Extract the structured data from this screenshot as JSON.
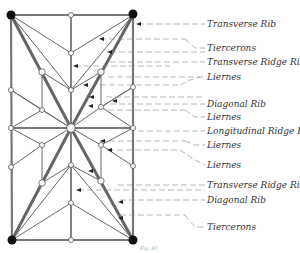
{
  "diagram": {
    "colors": {
      "rib": "#555555",
      "rib_light": "#999999",
      "boss_fill": "#ffffff",
      "corner_fill": "#111111",
      "leader": "#777777",
      "text": "#333333"
    },
    "labels": [
      {
        "text": "Transverse Rib",
        "y": 24
      },
      {
        "text": "Tiercerons",
        "y": 48
      },
      {
        "text": "Transverse Ridge Rib",
        "y": 62
      },
      {
        "text": "Liernes",
        "y": 77
      },
      {
        "text": "Diagonal Rib",
        "y": 104
      },
      {
        "text": "Liernes",
        "y": 117
      },
      {
        "text": "Longitudinal Ridge Rib",
        "y": 131
      },
      {
        "text": "Liernes",
        "y": 145
      },
      {
        "text": "Liernes",
        "y": 165
      },
      {
        "text": "Transverse Ridge Rib",
        "y": 185
      },
      {
        "text": "Diagonal Rib",
        "y": 200
      },
      {
        "text": "Tiercerons",
        "y": 227
      }
    ],
    "caption": "Fig. 81"
  }
}
